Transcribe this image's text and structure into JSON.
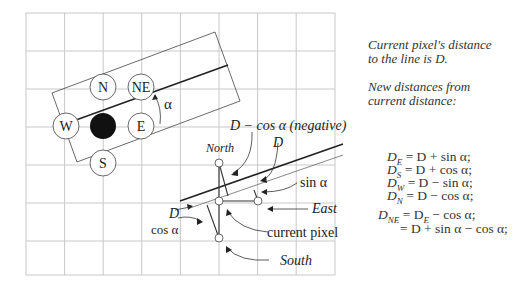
{
  "diagram": {
    "compass_labels": {
      "n": "N",
      "ne": "NE",
      "w": "W",
      "e": "E",
      "s": "S"
    },
    "angle_label": "α",
    "callouts": {
      "neg": "D − cos α (negative)",
      "d_top": "D",
      "north": "North",
      "sin": "sin α",
      "east": "East",
      "d_left": "D",
      "cos": "cos α",
      "current": "current pixel",
      "south": "South"
    }
  },
  "notes": {
    "line1": "Current pixel's distance",
    "line2": "to the line is D.",
    "line3": "New distances from",
    "line4": "current distance:"
  },
  "equations": [
    {
      "lhs": "D",
      "sub": "E",
      "rhs": "= D + sin α;"
    },
    {
      "lhs": "D",
      "sub": "S",
      "rhs": "= D + cos α;"
    },
    {
      "lhs": "D",
      "sub": "W",
      "rhs": "= D − sin α;"
    },
    {
      "lhs": "D",
      "sub": "N",
      "rhs": "= D − cos α;"
    },
    {
      "lhs": "D",
      "sub": "NE",
      "rhs": "= D",
      "sub2": "E",
      "rhs2": " − cos α;"
    },
    {
      "cont": "= D + sin α − cos α;"
    }
  ]
}
